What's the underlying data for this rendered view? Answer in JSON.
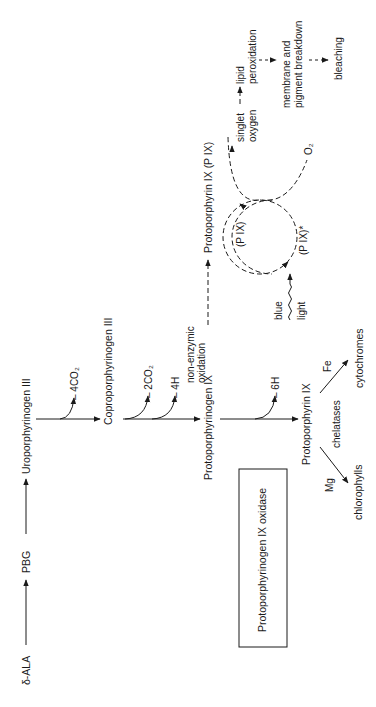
{
  "diagram": {
    "title_box": "Protoporphyrinogen IX oxidase",
    "nodes": {
      "ala": "δ-ALA",
      "pbg": "PBG",
      "uro": "Uroporphyrinogen III",
      "copro": "Coproporphyrinogen III",
      "protogen": "Protoporphyrinogen IX",
      "proto_enzymatic": "Protoporphyrin IX",
      "proto_nonenz": "Protoporphyrin IX  (P IX)",
      "chlorophylls": "chlorophylls",
      "cytochromes": "cytochromes",
      "pix": "(P IX)",
      "pix_excited": "(P IX)*",
      "singlet_1": "singlet",
      "singlet_2": "oxygen",
      "o2": "O₂",
      "lipid_1": "lipid",
      "lipid_2": "peroxidation",
      "membrane_1": "membrane and",
      "membrane_2": "pigment breakdown",
      "bleaching": "bleaching"
    },
    "side_products": {
      "uro_out": "– 4CO₂",
      "copro_out1": "– 2CO₂",
      "copro_out2": "– 4H",
      "protogen_out": "– 6H"
    },
    "labels": {
      "nonenz_1": "non-enzymic",
      "nonenz_2": "oxidation",
      "chelatases": "chelatases",
      "mg": "Mg",
      "fe": "Fe",
      "blue": "blue",
      "light": "light"
    }
  }
}
